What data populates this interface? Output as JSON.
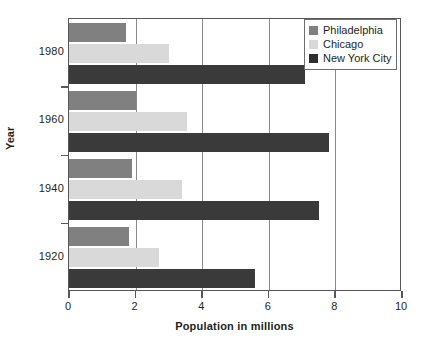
{
  "chart_data": {
    "type": "bar",
    "orientation": "horizontal",
    "title": "",
    "xlabel": "Population in millions",
    "ylabel": "Year",
    "xlim": [
      0,
      10
    ],
    "xticks": [
      "0",
      "2",
      "4",
      "6",
      "8",
      "10"
    ],
    "xtick_values": [
      0,
      2,
      4,
      6,
      8,
      10
    ],
    "categories": [
      "1980",
      "1960",
      "1940",
      "1920"
    ],
    "grid": "vertical",
    "legend_position": "top-right",
    "series": [
      {
        "name": "Philadelphia",
        "color": "#808080",
        "values": [
          1.7,
          2.0,
          1.9,
          1.8
        ]
      },
      {
        "name": "Chicago",
        "color": "#d9d9d9",
        "values": [
          3.0,
          3.55,
          3.4,
          2.7
        ]
      },
      {
        "name": "New York City",
        "color": "#3a3a3a",
        "values": [
          7.1,
          7.8,
          7.5,
          5.6
        ]
      }
    ]
  },
  "axes": {
    "x_title": "Population in millions",
    "y_title": "Year"
  },
  "legend": {
    "items": [
      {
        "label": "Philadelphia",
        "color": "#808080"
      },
      {
        "label": "Chicago",
        "color": "#d9d9d9"
      },
      {
        "label": "New York City",
        "color": "#2f2f2f"
      }
    ]
  },
  "colors": {
    "axis": "#58585a",
    "grid": "#8a8a8c",
    "text": "#231f20",
    "background": "#ffffff"
  }
}
